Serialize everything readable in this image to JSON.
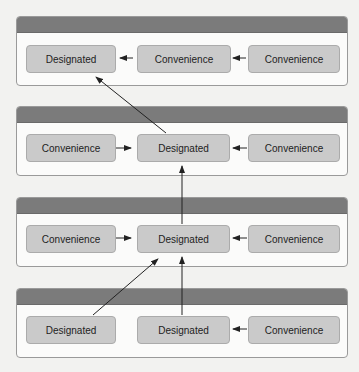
{
  "diagram": {
    "type": "initializer-delegation-chain",
    "levels": [
      {
        "boxes": [
          {
            "label": "Designated"
          },
          {
            "label": "Convenience"
          },
          {
            "label": "Convenience"
          }
        ]
      },
      {
        "boxes": [
          {
            "label": "Convenience"
          },
          {
            "label": "Designated"
          },
          {
            "label": "Convenience"
          }
        ]
      },
      {
        "boxes": [
          {
            "label": "Convenience"
          },
          {
            "label": "Designated"
          },
          {
            "label": "Convenience"
          }
        ]
      },
      {
        "boxes": [
          {
            "label": "Designated"
          },
          {
            "label": "Designated"
          },
          {
            "label": "Convenience"
          }
        ]
      }
    ],
    "arrows": [
      {
        "from": "level1.box2",
        "to": "level1.box1",
        "direction": "left"
      },
      {
        "from": "level1.box3",
        "to": "level1.box2",
        "direction": "left"
      },
      {
        "from": "level2.box2",
        "to": "level1.box1",
        "direction": "up-left"
      },
      {
        "from": "level2.box1",
        "to": "level2.box2",
        "direction": "right"
      },
      {
        "from": "level2.box3",
        "to": "level2.box2",
        "direction": "left"
      },
      {
        "from": "level3.box2",
        "to": "level2.box2",
        "direction": "up"
      },
      {
        "from": "level3.box1",
        "to": "level3.box2",
        "direction": "right"
      },
      {
        "from": "level3.box3",
        "to": "level3.box2",
        "direction": "left"
      },
      {
        "from": "level4.box1",
        "to": "level3.box2",
        "direction": "up-right"
      },
      {
        "from": "level4.box2",
        "to": "level3.box2",
        "direction": "up"
      },
      {
        "from": "level4.box3",
        "to": "level4.box2",
        "direction": "left"
      }
    ],
    "colors": {
      "background": "#f2f2f0",
      "panel_fill": "#fbfbfa",
      "panel_header": "#7b7b7b",
      "box_fill": "#cacaca",
      "arrow": "#222222"
    }
  }
}
